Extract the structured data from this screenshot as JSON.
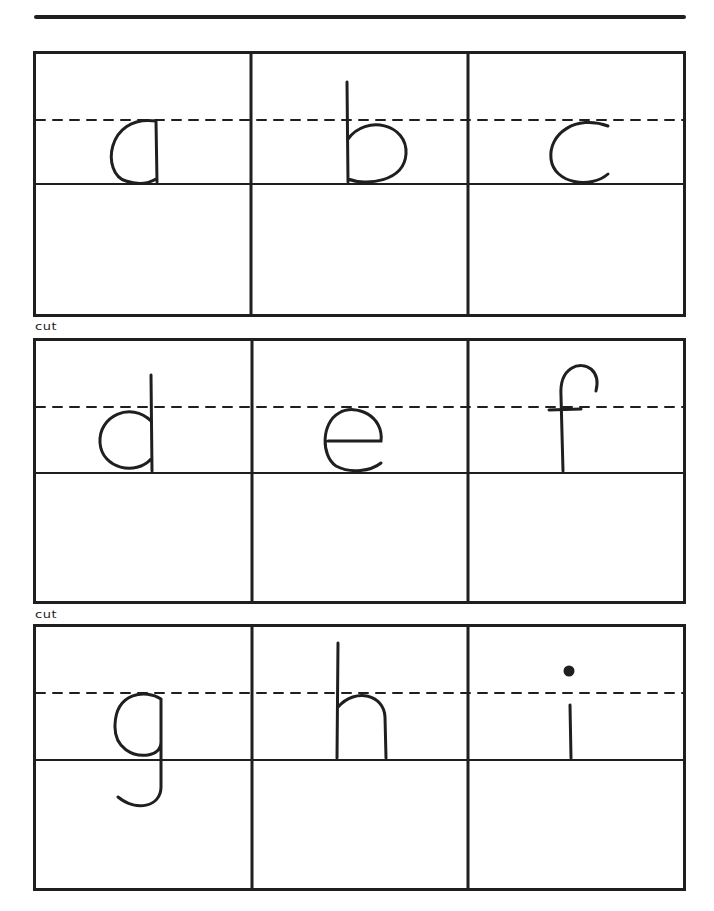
{
  "worksheet": {
    "cut_label": "cut",
    "rows": [
      {
        "cells": [
          {
            "letter": "a"
          },
          {
            "letter": "b"
          },
          {
            "letter": "c"
          }
        ]
      },
      {
        "cells": [
          {
            "letter": "d"
          },
          {
            "letter": "e"
          },
          {
            "letter": "f"
          }
        ]
      },
      {
        "cells": [
          {
            "letter": "g"
          },
          {
            "letter": "h"
          },
          {
            "letter": "i"
          }
        ]
      }
    ]
  }
}
